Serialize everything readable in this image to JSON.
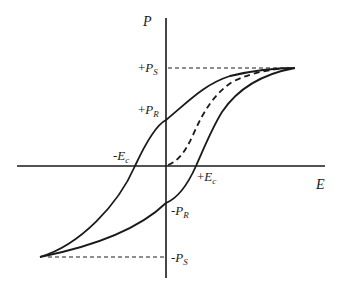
{
  "diagram": {
    "type": "ferroelectric hysteresis loop",
    "axes": {
      "x_label": "E",
      "y_label": "P"
    },
    "labels": {
      "plus_ps": {
        "sign": "+",
        "main": "P",
        "sub": "S"
      },
      "plus_pr": {
        "sign": "+",
        "main": "P",
        "sub": "R"
      },
      "minus_ec": {
        "sign": "-",
        "main": "E",
        "sub": "c"
      },
      "plus_ec": {
        "sign": "+",
        "main": "E",
        "sub": "c"
      },
      "minus_pr": {
        "sign": "-",
        "main": "P",
        "sub": "R"
      },
      "minus_ps": {
        "sign": "-",
        "main": "P",
        "sub": "S"
      }
    },
    "curves": [
      {
        "name": "upper-branch",
        "style": "solid"
      },
      {
        "name": "lower-branch",
        "style": "solid"
      },
      {
        "name": "initial-polarization-curve",
        "style": "dashed"
      }
    ],
    "colors": {
      "line": "#1a1a1a",
      "background": "#ffffff"
    }
  }
}
